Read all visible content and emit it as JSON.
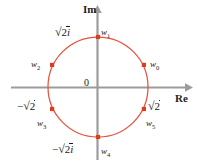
{
  "figure": {
    "name": "complex-plane-sixth-roots",
    "axes": {
      "imaginary_label": "Im",
      "real_label": "Re",
      "origin_label": "0"
    },
    "ticks": [
      {
        "id": "tick-pos-imag",
        "text": "√2i",
        "sign": "",
        "radicand": "2",
        "suffix": "i"
      },
      {
        "id": "tick-neg-imag",
        "text": "−√2i",
        "sign": "−",
        "radicand": "2",
        "suffix": "i"
      },
      {
        "id": "tick-pos-real",
        "text": "√2",
        "sign": "",
        "radicand": "2",
        "suffix": ""
      },
      {
        "id": "tick-neg-real",
        "text": "−√2",
        "sign": "−",
        "radicand": "2",
        "suffix": ""
      }
    ],
    "points": [
      {
        "id": "w0",
        "base": "w",
        "index": "0",
        "angle_deg": 26
      },
      {
        "id": "w1",
        "base": "w",
        "index": "1",
        "angle_deg": 90
      },
      {
        "id": "w2",
        "base": "w",
        "index": "2",
        "angle_deg": 154
      },
      {
        "id": "w3",
        "base": "w",
        "index": "3",
        "angle_deg": 206
      },
      {
        "id": "w4",
        "base": "w",
        "index": "4",
        "angle_deg": 270
      },
      {
        "id": "w5",
        "base": "w",
        "index": "5",
        "angle_deg": 334
      }
    ],
    "colors": {
      "curve": "#e6533c",
      "marker": "#e03b1e",
      "axis": "#9c9c9c",
      "text": "#1a1a1a",
      "background": "#ffffff"
    },
    "geometry": {
      "center_x": 98,
      "center_y": 87,
      "radius": 50
    }
  }
}
